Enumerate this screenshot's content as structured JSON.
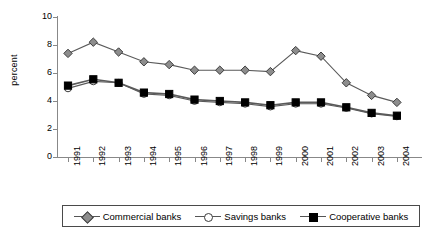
{
  "chart_data": {
    "type": "line",
    "title": "",
    "xlabel": "",
    "ylabel": "percent",
    "ylim": [
      0,
      10
    ],
    "yticks": [
      0,
      2,
      4,
      6,
      8,
      10
    ],
    "grid": false,
    "legend_position": "bottom",
    "categories": [
      "1991",
      "1992",
      "1993",
      "1994",
      "1995",
      "1996",
      "1997",
      "1998",
      "1999",
      "2000",
      "2001",
      "2002",
      "2003",
      "2004"
    ],
    "series": [
      {
        "name": "Commercial banks",
        "marker": "diamond",
        "color": "#8d8d8d",
        "values": [
          7.4,
          8.2,
          7.5,
          6.8,
          6.6,
          6.2,
          6.2,
          6.2,
          6.1,
          7.6,
          7.2,
          5.3,
          4.4,
          3.9
        ]
      },
      {
        "name": "Savings banks",
        "marker": "circle",
        "color": "#ffffff",
        "values": [
          4.9,
          5.4,
          5.3,
          4.5,
          4.4,
          4.0,
          3.9,
          3.8,
          3.6,
          3.8,
          3.8,
          3.5,
          3.1,
          2.9
        ]
      },
      {
        "name": "Cooperative banks",
        "marker": "square",
        "color": "#000000",
        "values": [
          5.1,
          5.55,
          5.3,
          4.6,
          4.5,
          4.1,
          4.0,
          3.9,
          3.7,
          3.9,
          3.9,
          3.55,
          3.15,
          2.95
        ]
      }
    ]
  },
  "axis": {
    "y_title": "percent",
    "y_tick_labels": [
      "0",
      "2",
      "4",
      "6",
      "8",
      "10"
    ],
    "x_tick_labels": [
      "1991",
      "1992",
      "1993",
      "1994",
      "1995",
      "1996",
      "1997",
      "1998",
      "1999",
      "2000",
      "2001",
      "2002",
      "2003",
      "2004"
    ]
  },
  "legend": {
    "items": [
      {
        "label": "Commercial banks",
        "marker": "diamond-marker-icon"
      },
      {
        "label": "Savings banks",
        "marker": "circle-marker-icon"
      },
      {
        "label": "Cooperative banks",
        "marker": "square-marker-icon"
      }
    ]
  },
  "colors": {
    "commercial": "#8d8d8d",
    "savings": "#ffffff",
    "cooperative": "#000000",
    "line": "#5a5a5a",
    "axis": "#888888",
    "marker_edge": "#3b3b3b"
  }
}
